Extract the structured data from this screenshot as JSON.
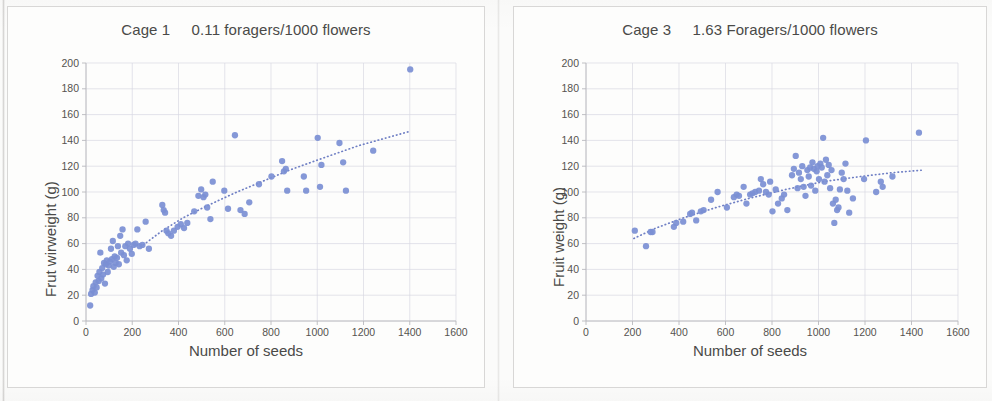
{
  "page": {
    "background_color": "#fbfbfa",
    "marker_color": "#7b8fd4",
    "trendline_color": "#6f7fc4",
    "gridline_color": "#d9d9e3",
    "axis_color": "#b9b9bd",
    "text_color": "#4a4a48"
  },
  "charts": [
    {
      "id": "cage-1",
      "title": "Cage 1     0.11 foragers/1000 flowers",
      "xlabel": "Number of seeds",
      "ylabel": "Frut wirweight (g)",
      "xticks": [
        "0",
        "200",
        "400",
        "600",
        "800",
        "1000",
        "1200",
        "1400",
        "1600"
      ],
      "yticks": [
        "0",
        "20",
        "40",
        "60",
        "80",
        "100",
        "120",
        "140",
        "160",
        "180",
        "200"
      ]
    },
    {
      "id": "cage-3",
      "title": "Cage 3     1.63 Foragers/1000 flowers",
      "xlabel": "Number of seeds",
      "ylabel": "Fruit weight (g)",
      "xticks": [
        "0",
        "200",
        "400",
        "600",
        "800",
        "1000",
        "1200",
        "1400",
        "1600"
      ],
      "yticks": [
        "0",
        "20",
        "40",
        "60",
        "80",
        "100",
        "120",
        "140",
        "160",
        "180",
        "200"
      ]
    }
  ],
  "chart_data": [
    {
      "type": "scatter",
      "id": "cage-1",
      "title": "Cage 1     0.11 foragers/1000 flowers",
      "xlabel": "Number of seeds",
      "ylabel": "Frut wirweight (g)",
      "xlim": [
        0,
        1600
      ],
      "ylim": [
        0,
        200
      ],
      "xtick_step": 200,
      "ytick_step": 20,
      "grid": true,
      "legend": "none",
      "series": [
        {
          "name": "Fruit weight vs seeds (Cage 1)",
          "marker_color": "#7b8fd4",
          "points": [
            [
              18,
              12
            ],
            [
              22,
              21
            ],
            [
              28,
              24
            ],
            [
              32,
              27
            ],
            [
              38,
              22
            ],
            [
              42,
              30
            ],
            [
              46,
              26
            ],
            [
              50,
              35
            ],
            [
              55,
              31
            ],
            [
              58,
              38
            ],
            [
              62,
              53
            ],
            [
              66,
              33
            ],
            [
              70,
              41
            ],
            [
              74,
              36
            ],
            [
              78,
              45
            ],
            [
              82,
              29
            ],
            [
              86,
              44
            ],
            [
              90,
              47
            ],
            [
              94,
              38
            ],
            [
              98,
              43
            ],
            [
              104,
              46
            ],
            [
              108,
              56
            ],
            [
              112,
              48
            ],
            [
              116,
              62
            ],
            [
              120,
              42
            ],
            [
              124,
              50
            ],
            [
              128,
              45
            ],
            [
              134,
              49
            ],
            [
              138,
              58
            ],
            [
              142,
              44
            ],
            [
              148,
              66
            ],
            [
              152,
              53
            ],
            [
              158,
              71
            ],
            [
              164,
              51
            ],
            [
              170,
              58
            ],
            [
              176,
              47
            ],
            [
              182,
              60
            ],
            [
              190,
              56
            ],
            [
              198,
              52
            ],
            [
              206,
              59
            ],
            [
              214,
              60
            ],
            [
              222,
              71
            ],
            [
              232,
              58
            ],
            [
              244,
              59
            ],
            [
              258,
              77
            ],
            [
              272,
              56
            ],
            [
              330,
              90
            ],
            [
              336,
              86
            ],
            [
              342,
              84
            ],
            [
              348,
              70
            ],
            [
              356,
              68
            ],
            [
              368,
              66
            ],
            [
              380,
              70
            ],
            [
              396,
              73
            ],
            [
              410,
              75
            ],
            [
              424,
              72
            ],
            [
              438,
              76
            ],
            [
              468,
              85
            ],
            [
              486,
              97
            ],
            [
              498,
              102
            ],
            [
              508,
              96
            ],
            [
              516,
              98
            ],
            [
              524,
              88
            ],
            [
              538,
              79
            ],
            [
              548,
              108
            ],
            [
              598,
              101
            ],
            [
              614,
              87
            ],
            [
              644,
              144
            ],
            [
              668,
              86
            ],
            [
              686,
              83
            ],
            [
              706,
              92
            ],
            [
              748,
              106
            ],
            [
              802,
              112
            ],
            [
              848,
              124
            ],
            [
              856,
              116
            ],
            [
              864,
              118
            ],
            [
              870,
              101
            ],
            [
              942,
              112
            ],
            [
              952,
              101
            ],
            [
              1002,
              142
            ],
            [
              1012,
              104
            ],
            [
              1018,
              121
            ],
            [
              1096,
              138
            ],
            [
              1112,
              123
            ],
            [
              1124,
              101
            ],
            [
              1242,
              132
            ],
            [
              1402,
              195
            ]
          ]
        }
      ],
      "trendline": {
        "style": "dotted",
        "shape": "logarithmic",
        "color": "#6f7fc4",
        "points": [
          [
            248,
            59
          ],
          [
            330,
            70
          ],
          [
            420,
            80
          ],
          [
            520,
            89
          ],
          [
            640,
            99
          ],
          [
            760,
            108
          ],
          [
            880,
            117
          ],
          [
            1020,
            126
          ],
          [
            1180,
            136
          ],
          [
            1400,
            147
          ]
        ]
      }
    },
    {
      "type": "scatter",
      "id": "cage-3",
      "title": "Cage 3     1.63 Foragers/1000 flowers",
      "xlabel": "Number of seeds",
      "ylabel": "Fruit weight (g)",
      "xlim": [
        0,
        1600
      ],
      "ylim": [
        0,
        200
      ],
      "xtick_step": 200,
      "ytick_step": 20,
      "grid": true,
      "legend": "none",
      "series": [
        {
          "name": "Fruit weight vs seeds (Cage 3)",
          "marker_color": "#7b8fd4",
          "points": [
            [
              210,
              70
            ],
            [
              258,
              58
            ],
            [
              278,
              69
            ],
            [
              286,
              69
            ],
            [
              378,
              73
            ],
            [
              388,
              76
            ],
            [
              418,
              77
            ],
            [
              448,
              83
            ],
            [
              456,
              84
            ],
            [
              474,
              78
            ],
            [
              494,
              85
            ],
            [
              506,
              86
            ],
            [
              538,
              94
            ],
            [
              566,
              100
            ],
            [
              606,
              88
            ],
            [
              636,
              96
            ],
            [
              648,
              98
            ],
            [
              658,
              97
            ],
            [
              678,
              104
            ],
            [
              690,
              91
            ],
            [
              706,
              98
            ],
            [
              716,
              99
            ],
            [
              728,
              100
            ],
            [
              744,
              101
            ],
            [
              752,
              110
            ],
            [
              762,
              106
            ],
            [
              774,
              100
            ],
            [
              786,
              98
            ],
            [
              792,
              108
            ],
            [
              802,
              85
            ],
            [
              816,
              102
            ],
            [
              826,
              91
            ],
            [
              842,
              95
            ],
            [
              852,
              98
            ],
            [
              866,
              86
            ],
            [
              886,
              113
            ],
            [
              894,
              118
            ],
            [
              902,
              128
            ],
            [
              910,
              103
            ],
            [
              916,
              115
            ],
            [
              924,
              110
            ],
            [
              930,
              120
            ],
            [
              936,
              104
            ],
            [
              944,
              97
            ],
            [
              952,
              117
            ],
            [
              958,
              112
            ],
            [
              964,
              119
            ],
            [
              968,
              105
            ],
            [
              974,
              123
            ],
            [
              980,
              118
            ],
            [
              986,
              101
            ],
            [
              992,
              116
            ],
            [
              996,
              120
            ],
            [
              1002,
              110
            ],
            [
              1008,
              122
            ],
            [
              1014,
              119
            ],
            [
              1020,
              142
            ],
            [
              1026,
              108
            ],
            [
              1032,
              125
            ],
            [
              1038,
              113
            ],
            [
              1044,
              121
            ],
            [
              1050,
              103
            ],
            [
              1056,
              117
            ],
            [
              1062,
              91
            ],
            [
              1068,
              76
            ],
            [
              1074,
              94
            ],
            [
              1080,
              86
            ],
            [
              1086,
              88
            ],
            [
              1092,
              102
            ],
            [
              1100,
              115
            ],
            [
              1108,
              110
            ],
            [
              1116,
              122
            ],
            [
              1124,
              101
            ],
            [
              1132,
              84
            ],
            [
              1148,
              95
            ],
            [
              1196,
              110
            ],
            [
              1204,
              140
            ],
            [
              1248,
              100
            ],
            [
              1268,
              108
            ],
            [
              1276,
              104
            ],
            [
              1318,
              112
            ],
            [
              1432,
              146
            ]
          ]
        }
      ],
      "trendline": {
        "style": "dotted",
        "shape": "logarithmic",
        "color": "#6f7fc4",
        "points": [
          [
            206,
            64
          ],
          [
            300,
            72
          ],
          [
            420,
            80
          ],
          [
            560,
            88
          ],
          [
            700,
            95
          ],
          [
            860,
            102
          ],
          [
            1020,
            108
          ],
          [
            1180,
            112
          ],
          [
            1320,
            115
          ],
          [
            1450,
            117
          ]
        ]
      }
    }
  ]
}
